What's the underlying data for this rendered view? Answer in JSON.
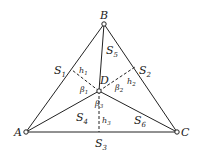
{
  "diagram": {
    "type": "geometry",
    "points": {
      "A": {
        "label": "A",
        "x": 26,
        "y": 132
      },
      "B": {
        "label": "B",
        "x": 104,
        "y": 24
      },
      "C": {
        "label": "C",
        "x": 177,
        "y": 132
      },
      "D": {
        "label": "D",
        "x": 99,
        "y": 91
      }
    },
    "feet": {
      "F1": {
        "x": 72,
        "y": 70
      },
      "F2": {
        "x": 135,
        "y": 67
      },
      "F3": {
        "x": 99,
        "y": 132
      }
    },
    "labels": {
      "A": "A",
      "B": "B",
      "C": "C",
      "D": "D",
      "S1": "S",
      "S1_sub": "1",
      "S2": "S",
      "S2_sub": "2",
      "S3": "S",
      "S3_sub": "3",
      "S4": "S",
      "S4_sub": "4",
      "S5": "S",
      "S5_sub": "5",
      "S6": "S",
      "S6_sub": "6",
      "h1": "h",
      "h1_sub": "1",
      "h2": "h",
      "h2_sub": "2",
      "h3": "h",
      "h3_sub": "3",
      "b1": "β",
      "b1_sub": "1",
      "b2": "β",
      "b2_sub": "2",
      "b3": "β",
      "b3_sub": "3"
    },
    "colors": {
      "line": "#222222",
      "background": "#ffffff"
    }
  }
}
